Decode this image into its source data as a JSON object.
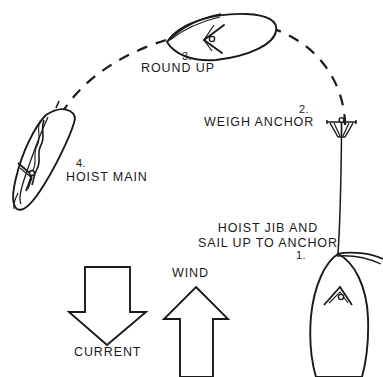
{
  "diagram": {
    "background_color": "#ffffff",
    "ink_color": "#1a1a1a",
    "width": 383,
    "height": 377
  },
  "steps": [
    {
      "number": "1.",
      "label": "HOIST JIB AND\nSAIL UP TO ANCHOR"
    },
    {
      "number": "2.",
      "label": "WEIGH ANCHOR"
    },
    {
      "number": "3.",
      "label": "ROUND UP"
    },
    {
      "number": "4.",
      "label": "HOIST MAIN"
    }
  ],
  "arrows": [
    {
      "name": "current",
      "label": "CURRENT",
      "direction": "down"
    },
    {
      "name": "wind",
      "label": "WIND",
      "direction": "up"
    }
  ],
  "objects": [
    {
      "name": "boat-1",
      "kind": "sailboat-plan-view",
      "orientation": "bow-up"
    },
    {
      "name": "boat-3",
      "kind": "sailboat-plan-view",
      "orientation": "bow-left"
    },
    {
      "name": "boat-4",
      "kind": "sailboat-plan-view",
      "orientation": "heeled-luffing"
    },
    {
      "name": "anchor",
      "kind": "anchor-symbol"
    },
    {
      "name": "anchor-rode",
      "kind": "line"
    },
    {
      "name": "track",
      "kind": "dashed-arc"
    }
  ]
}
